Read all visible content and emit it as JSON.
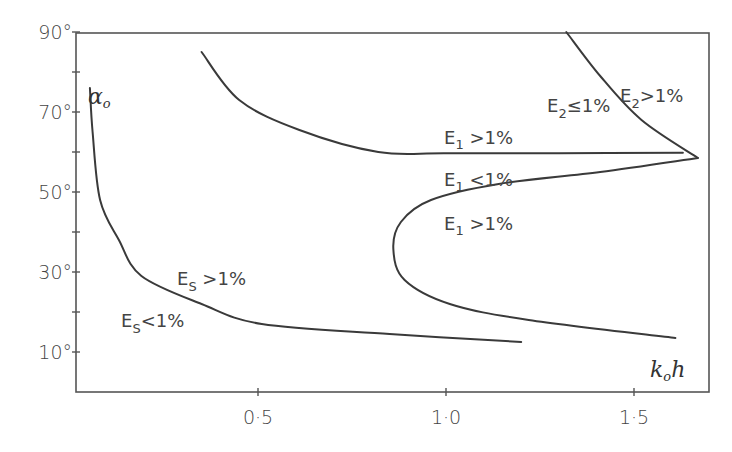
{
  "chart_data": {
    "type": "line",
    "title": "",
    "xlabel": "k_o h",
    "ylabel": "α_o",
    "xlim": [
      0.03,
      1.7
    ],
    "ylim": [
      0,
      90
    ],
    "grid": false,
    "legend": null,
    "x_ticks": [
      {
        "value": 0.5,
        "label": "0·5"
      },
      {
        "value": 1.0,
        "label": "1·0"
      },
      {
        "value": 1.5,
        "label": "1·5"
      }
    ],
    "y_ticks": [
      {
        "value": 10,
        "label": "10°"
      },
      {
        "value": 20,
        "label": ""
      },
      {
        "value": 30,
        "label": "30°"
      },
      {
        "value": 40,
        "label": ""
      },
      {
        "value": 50,
        "label": "50°"
      },
      {
        "value": 60,
        "label": ""
      },
      {
        "value": 70,
        "label": "70°"
      },
      {
        "value": 80,
        "label": ""
      },
      {
        "value": 90,
        "label": "90°"
      }
    ],
    "series": [
      {
        "name": "E_s boundary",
        "x": [
          0.053,
          0.06,
          0.08,
          0.13,
          0.19,
          0.35,
          0.51,
          0.85,
          1.2
        ],
        "y": [
          76,
          65,
          48,
          38,
          29,
          22,
          17,
          14.5,
          12.5
        ]
      },
      {
        "name": "E_1 boundary (upper)",
        "x": [
          0.35,
          0.45,
          0.61,
          0.82,
          1.0,
          1.3,
          1.63
        ],
        "y": [
          85,
          73,
          65.5,
          60,
          59.7,
          59.7,
          59.8
        ]
      },
      {
        "name": "E_1 boundary (C-shaped)",
        "x": [
          1.67,
          1.41,
          1.14,
          0.96,
          0.88,
          0.86,
          0.89,
          1.01,
          1.22,
          1.61
        ],
        "y": [
          58.5,
          55,
          52,
          48,
          42.5,
          35.5,
          28,
          22,
          18,
          13.5
        ]
      },
      {
        "name": "E_2 boundary",
        "x": [
          1.32,
          1.41,
          1.52,
          1.67
        ],
        "y": [
          90,
          79,
          68,
          58.5
        ]
      }
    ],
    "annotations": [
      {
        "text": "α_o",
        "x": 0.07,
        "y": 79
      },
      {
        "text": "E_1 > 1%",
        "x": 1.06,
        "y": 63
      },
      {
        "text": "E_1 < 1%",
        "x": 1.06,
        "y": 53
      },
      {
        "text": "E_1 > 1%",
        "x": 1.06,
        "y": 43
      },
      {
        "text": "E_S > 1%",
        "x": 0.32,
        "y": 27
      },
      {
        "text": "E_S < 1%",
        "x": 0.17,
        "y": 17
      },
      {
        "text": "E_2 ≤ 1%",
        "x": 1.28,
        "y": 78
      },
      {
        "text": "E_2 > 1%",
        "x": 1.48,
        "y": 82
      },
      {
        "text": "k_o h",
        "x": 1.62,
        "y": 8
      }
    ]
  },
  "labels": {
    "alpha": "α",
    "alpha_sub": "o",
    "k": "k",
    "k_sub": "o",
    "h": "h",
    "e1_gt_top": {
      "E": "E",
      "sub": "1",
      "rest": " >1%"
    },
    "e1_lt": {
      "E": "E",
      "sub": "1",
      "rest": " <1%"
    },
    "e1_gt_bottom": {
      "E": "E",
      "sub": "1",
      "rest": " >1%"
    },
    "es_gt": {
      "E": "E",
      "sub": "S",
      "rest": " >1%"
    },
    "es_lt": {
      "E": "E",
      "sub": "S",
      "rest": "<1%"
    },
    "e2_le": {
      "E": "E",
      "sub": "2",
      "rest": "≤1%"
    },
    "e2_gt": {
      "E": "E",
      "sub": "2",
      "rest": ">1%"
    }
  }
}
